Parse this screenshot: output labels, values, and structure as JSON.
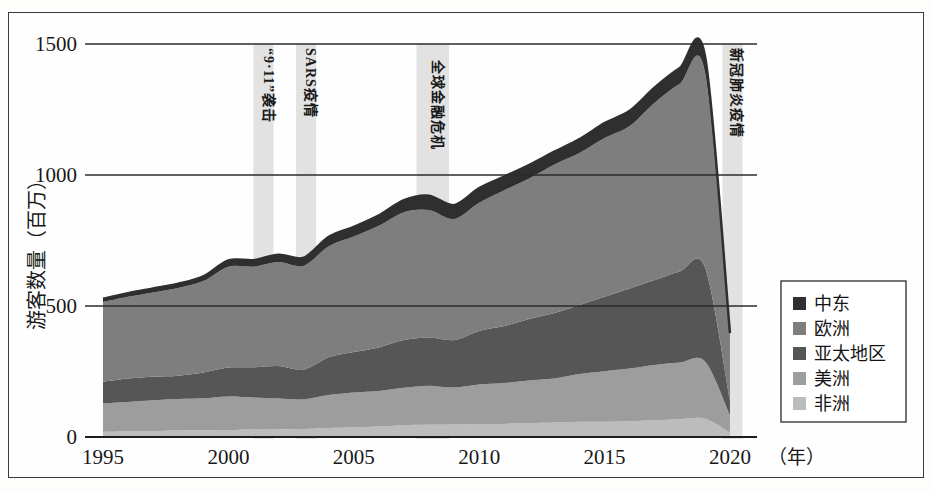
{
  "figure": {
    "background_color": "#fefefe",
    "frame_color": "#3a3a3a"
  },
  "axes": {
    "y_label": "游客数量（百万）",
    "y_ticks": [
      "0",
      "500",
      "1000",
      "1500"
    ],
    "x_ticks": [
      "1995",
      "2000",
      "2005",
      "2010",
      "2015",
      "2020"
    ],
    "x_unit": "（年）"
  },
  "legend": {
    "items": [
      {
        "label": "中东",
        "color": "#2f2f2f"
      },
      {
        "label": "欧洲",
        "color": "#7e7e7e"
      },
      {
        "label": "亚太地区",
        "color": "#565656"
      },
      {
        "label": "美洲",
        "color": "#9d9d9d"
      },
      {
        "label": "非洲",
        "color": "#bcbcbc"
      }
    ]
  },
  "event_bands": [
    {
      "label": "“9·11”袭击",
      "start": 2001.0,
      "end": 2001.8,
      "color": "#e2e2e2"
    },
    {
      "label": "SARS疫情",
      "start": 2002.7,
      "end": 2003.5,
      "color": "#e2e2e2"
    },
    {
      "label": "全球金融危机",
      "start": 2007.5,
      "end": 2008.8,
      "color": "#e2e2e2"
    },
    {
      "label": "新冠肺炎疫情",
      "start": 2019.7,
      "end": 2020.5,
      "color": "#e2e2e2"
    }
  ],
  "chart_data": {
    "type": "area",
    "title": "",
    "xlabel": "（年）",
    "ylabel": "游客数量（百万）",
    "xlim": [
      1995,
      2020.6
    ],
    "ylim": [
      0,
      1560
    ],
    "grid": true,
    "legend_position": "right",
    "stack_order_bottom_to_top": [
      "非洲",
      "美洲",
      "亚太地区",
      "欧洲",
      "中东"
    ],
    "x": [
      1995,
      1996,
      1997,
      1998,
      1999,
      2000,
      2001,
      2002,
      2003,
      2004,
      2005,
      2006,
      2007,
      2008,
      2009,
      2010,
      2011,
      2012,
      2013,
      2014,
      2015,
      2016,
      2017,
      2018,
      2019,
      2020
    ],
    "series": [
      {
        "name": "非洲",
        "values": [
          20,
          21,
          23,
          25,
          26,
          27,
          29,
          30,
          31,
          34,
          37,
          40,
          45,
          48,
          48,
          50,
          50,
          53,
          55,
          58,
          58,
          60,
          64,
          68,
          70,
          18
        ]
      },
      {
        "name": "美洲",
        "values": [
          109,
          113,
          117,
          120,
          122,
          128,
          122,
          117,
          113,
          126,
          133,
          136,
          143,
          148,
          141,
          150,
          156,
          163,
          168,
          182,
          193,
          201,
          211,
          216,
          219,
          66
        ]
      },
      {
        "name": "亚太地区",
        "values": [
          82,
          89,
          90,
          89,
          98,
          110,
          115,
          124,
          113,
          144,
          154,
          166,
          182,
          184,
          181,
          205,
          218,
          234,
          250,
          264,
          284,
          306,
          324,
          348,
          360,
          58
        ]
      },
      {
        "name": "欧洲",
        "values": [
          304,
          312,
          322,
          335,
          349,
          385,
          384,
          397,
          397,
          424,
          441,
          464,
          488,
          486,
          462,
          489,
          518,
          537,
          567,
          580,
          606,
          620,
          677,
          716,
          745,
          236
        ]
      },
      {
        "name": "中东",
        "values": [
          13,
          14,
          15,
          16,
          18,
          24,
          25,
          28,
          30,
          36,
          37,
          40,
          46,
          55,
          53,
          56,
          52,
          52,
          49,
          53,
          57,
          58,
          58,
          60,
          62,
          19
        ]
      }
    ],
    "totals": [
      528,
      549,
      567,
      585,
      613,
      674,
      675,
      696,
      684,
      764,
      802,
      846,
      904,
      921,
      885,
      950,
      994,
      1039,
      1089,
      1137,
      1198,
      1245,
      1334,
      1408,
      1456,
      397
    ],
    "annotations": [
      "“9·11”袭击",
      "SARS疫情",
      "全球金融危机",
      "新冠肺炎疫情"
    ]
  }
}
